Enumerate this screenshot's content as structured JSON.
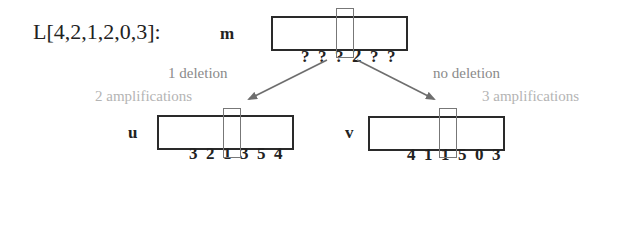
{
  "title": "L[4,2,1,2,0,3]:",
  "source": {
    "label": "m",
    "cells": [
      "?",
      "?",
      "?",
      "2",
      "?",
      "?"
    ],
    "highlight_index": 3
  },
  "branches": [
    {
      "label": "u",
      "deletion_text": "1 deletion",
      "amplification_text": "2 amplifications",
      "cells": [
        "3",
        "2",
        "1",
        "3",
        "5",
        "4"
      ],
      "highlight_index": 3
    },
    {
      "label": "v",
      "deletion_text": "no deletion",
      "amplification_text": "3 amplifications",
      "cells": [
        "4",
        "1",
        "1",
        "5",
        "0",
        "3"
      ],
      "highlight_index": 3
    }
  ],
  "colors": {
    "box_border": "#2a2a2a",
    "window_border": "#777777",
    "arrow": "#6e6e6e",
    "deletion_text": "#8a8a8a",
    "amplification_text": "#b4b4b4"
  }
}
